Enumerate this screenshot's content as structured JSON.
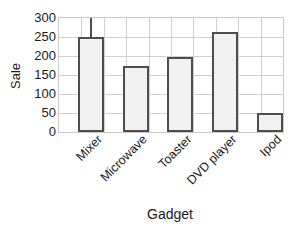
{
  "chart_data": {
    "type": "bar",
    "title": "",
    "xlabel": "Gadget",
    "ylabel": "Sale",
    "categories": [
      "Mixer",
      "Microwave",
      "Toaster",
      "DVD player",
      "Ipod"
    ],
    "values": [
      250,
      175,
      198,
      262,
      50
    ],
    "errors": [
      {
        "category": "Mixer",
        "upper": 300
      },
      {
        "category": "Microwave",
        "upper": null
      },
      {
        "category": "Toaster",
        "upper": null
      },
      {
        "category": "DVD player",
        "upper": null
      },
      {
        "category": "Ipod",
        "upper": null
      }
    ],
    "ylim": [
      0,
      300
    ],
    "yticks": [
      0,
      50,
      100,
      150,
      200,
      250,
      300
    ],
    "ytick_labels": [
      "0",
      "50",
      "100",
      "150",
      "200",
      "250",
      "300"
    ],
    "grid": true,
    "legend": null,
    "colors": {
      "bar_fill": "#f1f1f1",
      "bar_edge": "#4d4d4d",
      "grid": "#d0d0d0",
      "axis": "#c8c8c8",
      "text": "#1a1a1a",
      "background": "#ffffff"
    }
  }
}
